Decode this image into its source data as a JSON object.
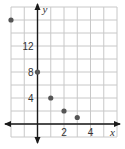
{
  "chart_data": {
    "type": "scatter",
    "title": "",
    "xlabel": "x",
    "ylabel": "y",
    "xlim": [
      -2,
      6
    ],
    "ylim": [
      -2,
      18
    ],
    "x_grid_step": 1,
    "y_grid_step": 2,
    "grid": true,
    "x_tick_labels": [
      {
        "value": 2,
        "label": "2"
      },
      {
        "value": 4,
        "label": "4"
      }
    ],
    "y_tick_labels": [
      {
        "value": 4,
        "label": "4"
      },
      {
        "value": 8,
        "label": "8"
      },
      {
        "value": 12,
        "label": "12"
      }
    ],
    "points": [
      {
        "x": -2,
        "y": 16
      },
      {
        "x": 0,
        "y": 8
      },
      {
        "x": 1,
        "y": 4
      },
      {
        "x": 2,
        "y": 2
      },
      {
        "x": 3,
        "y": 1
      }
    ],
    "colors": {
      "grid": "#c8c8c8",
      "axis": "#1a1a1a",
      "point": "#555555"
    }
  }
}
